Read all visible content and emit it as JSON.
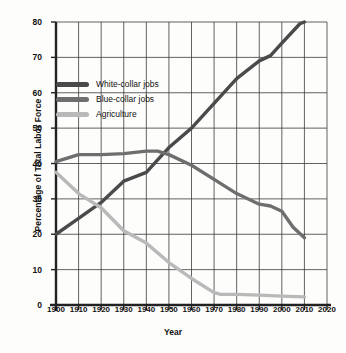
{
  "chart_data": {
    "type": "line",
    "title": "",
    "xlabel": "Year",
    "ylabel": "Percentage of Total Labor Force",
    "xlim": [
      1900,
      2020
    ],
    "ylim": [
      0,
      80
    ],
    "xticks": [
      "1900",
      "1910",
      "1920",
      "1930",
      "1940",
      "1950",
      "1960",
      "1970",
      "1980",
      "1990",
      "2000",
      "2010",
      "2020"
    ],
    "yticks": [
      "0",
      "10",
      "20",
      "30",
      "40",
      "50",
      "60",
      "70",
      "80"
    ],
    "grid": true,
    "legend_position": "upper-left-inside",
    "series": [
      {
        "name": "White-collar jobs",
        "color": "#4a4a4a",
        "x": [
          1900,
          1910,
          1920,
          1930,
          1940,
          1945,
          1950,
          1960,
          1970,
          1980,
          1990,
          1995,
          2000,
          2008,
          2010
        ],
        "values": [
          20,
          24.5,
          29,
          35,
          37.5,
          41,
          44.5,
          50,
          57,
          64,
          69,
          70.5,
          74,
          79.5,
          80
        ]
      },
      {
        "name": "Blue-collar jobs",
        "color": "#6e6e6e",
        "x": [
          1900,
          1910,
          1920,
          1930,
          1940,
          1945,
          1950,
          1960,
          1970,
          1980,
          1990,
          1995,
          2000,
          2005,
          2010
        ],
        "values": [
          40.5,
          42.5,
          42.5,
          42.8,
          43.5,
          43.5,
          42.5,
          39.5,
          35.5,
          31.5,
          28.5,
          28,
          26.5,
          22,
          19
        ]
      },
      {
        "name": "Agriculture",
        "color": "#b9b9b9",
        "x": [
          1900,
          1910,
          1920,
          1930,
          1940,
          1950,
          1960,
          1970,
          1973,
          1980,
          1990,
          2000,
          2010
        ],
        "values": [
          37.5,
          31.5,
          27.5,
          21,
          17.5,
          12,
          7.5,
          3.5,
          3,
          3,
          2.8,
          2.5,
          2.3
        ]
      }
    ]
  },
  "legend": {
    "items": [
      {
        "label": "White-collar jobs",
        "color": "#4a4a4a"
      },
      {
        "label": "Blue-collar jobs",
        "color": "#6e6e6e"
      },
      {
        "label": "Agriculture",
        "color": "#b9b9b9"
      }
    ]
  },
  "axis": {
    "x_title": "Year",
    "y_title": "Percentage of Total Labor Force"
  },
  "colors": {
    "grid": "#3b3b3b",
    "axis": "#222222",
    "background": "#fdfdfc"
  }
}
